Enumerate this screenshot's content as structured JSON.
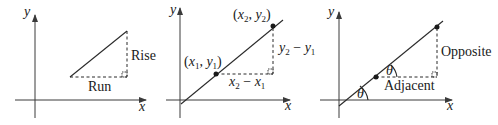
{
  "figure": {
    "panels": [
      {
        "name": "rise-over-run",
        "axis_x_label": "x",
        "axis_y_label": "y",
        "vertical_label": "Rise",
        "horizontal_label": "Run"
      },
      {
        "name": "two-point-slope",
        "axis_x_label": "x",
        "axis_y_label": "y",
        "point1_label": "(x1, y1)",
        "point2_label": "(x2, y2)",
        "vertical_label": "y2 − y1",
        "horizontal_label": "x2 − x1",
        "point1": {
          "x": "x",
          "sub": "1",
          "y": "y",
          "sub_y": "1"
        },
        "point2": {
          "x": "x",
          "sub": "2",
          "y": "y",
          "sub_y": "2"
        }
      },
      {
        "name": "trig-slope",
        "axis_x_label": "x",
        "axis_y_label": "y",
        "vertical_label": "Opposite",
        "horizontal_label": "Adjacent",
        "angle_label": "θ"
      }
    ]
  },
  "colors": {
    "stroke": "#2a2a2a",
    "background": "#ffffff"
  }
}
